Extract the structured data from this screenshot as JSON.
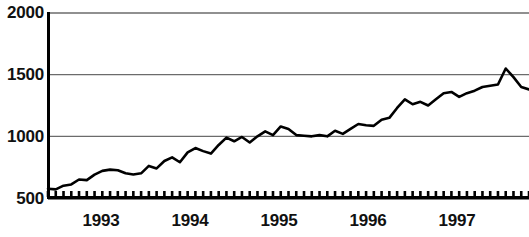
{
  "chart_data": {
    "type": "line",
    "title": "",
    "subtitle": "",
    "xlabel": "",
    "ylabel": "",
    "ylim": [
      500,
      2000
    ],
    "yticks": [
      500,
      1000,
      1500,
      2000
    ],
    "ytick_labels": [
      "500",
      "1000",
      "1500",
      "2000"
    ],
    "xlim": [
      "1992-10",
      "1997-12"
    ],
    "xtick_labels": [
      "1993",
      "1994",
      "1995",
      "1996",
      "1997"
    ],
    "xtick_positions": [
      101,
      190,
      279,
      368,
      457
    ],
    "grid": "horizontal",
    "legend": "none",
    "line_color": "#000000",
    "grid_color": "#6b6b6b",
    "axis_color": "#000000",
    "minor_tick_marks": "monthly",
    "series": [
      {
        "name": "Index",
        "x": [
          "1992-10",
          "1992-11",
          "1992-12",
          "1993-01",
          "1993-02",
          "1993-03",
          "1993-04",
          "1993-05",
          "1993-06",
          "1993-07",
          "1993-08",
          "1993-09",
          "1993-10",
          "1993-11",
          "1993-12",
          "1994-01",
          "1994-02",
          "1994-03",
          "1994-04",
          "1994-05",
          "1994-06",
          "1994-07",
          "1994-08",
          "1994-09",
          "1994-10",
          "1994-11",
          "1994-12",
          "1995-01",
          "1995-02",
          "1995-03",
          "1995-04",
          "1995-05",
          "1995-06",
          "1995-07",
          "1995-08",
          "1995-09",
          "1995-10",
          "1995-11",
          "1995-12",
          "1996-01",
          "1996-02",
          "1996-03",
          "1996-04",
          "1996-05",
          "1996-06",
          "1996-07",
          "1996-08",
          "1996-09",
          "1996-10",
          "1996-11",
          "1996-12",
          "1997-01",
          "1997-02",
          "1997-03",
          "1997-04",
          "1997-05",
          "1997-06",
          "1997-07",
          "1997-08",
          "1997-09",
          "1997-10",
          "1997-11",
          "1997-12"
        ],
        "values": [
          575,
          570,
          600,
          610,
          650,
          645,
          690,
          720,
          730,
          725,
          700,
          690,
          700,
          760,
          740,
          800,
          830,
          790,
          870,
          905,
          880,
          860,
          930,
          990,
          960,
          995,
          950,
          1000,
          1040,
          1010,
          1080,
          1060,
          1010,
          1005,
          1000,
          1010,
          1000,
          1045,
          1020,
          1060,
          1100,
          1090,
          1085,
          1135,
          1150,
          1230,
          1300,
          1260,
          1280,
          1250,
          1300,
          1350,
          1360,
          1320,
          1350,
          1370,
          1400,
          1410,
          1420,
          1550,
          1480,
          1400,
          1380
        ]
      }
    ]
  },
  "axis": {
    "y_labels": [
      "2000",
      "1500",
      "1000",
      "500"
    ],
    "x_labels": [
      "1993",
      "1994",
      "1995",
      "1996",
      "1997"
    ]
  }
}
